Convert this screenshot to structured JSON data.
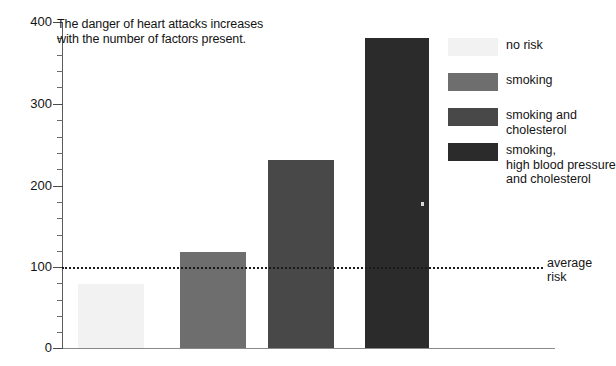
{
  "chart_data": {
    "type": "bar",
    "title": "The danger of heart attacks increases with the number of factors present.",
    "title_lines": [
      "The danger of heart attacks increases",
      "with the number of factors present."
    ],
    "xlabel": "",
    "ylabel": "",
    "ylim": [
      0,
      400
    ],
    "yticks": [
      0,
      100,
      200,
      300,
      400
    ],
    "ytick_labels": [
      "0",
      "100",
      "200",
      "300",
      "400"
    ],
    "minor_tick_step": 20,
    "grid": false,
    "legend_position": "right",
    "categories": [
      "no risk",
      "smoking",
      "smoking and cholesterol",
      "smoking, high blood pressure and cholesterol"
    ],
    "values": [
      78,
      118,
      231,
      380
    ],
    "bar_colors": [
      "#f2f2f2",
      "#6e6e6e",
      "#484848",
      "#2b2b2b"
    ],
    "annotations": [
      {
        "name": "average-risk-line",
        "label_lines": [
          "average",
          "risk"
        ],
        "value": 100,
        "style": "dotted"
      }
    ]
  },
  "title": {
    "line1": "The danger of heart attacks increases",
    "line2": "with the number of factors present."
  },
  "axis": {
    "y": {
      "t400": "400",
      "t300": "300",
      "t200": "200",
      "t100": "100",
      "t0": "0"
    }
  },
  "average_risk": {
    "line1": "average",
    "line2": "risk"
  },
  "legend": {
    "items": [
      {
        "label": "no risk",
        "color": "#f2f2f2"
      },
      {
        "label": "smoking",
        "color": "#6e6e6e"
      },
      {
        "label": "smoking and\ncholesterol",
        "color": "#484848"
      },
      {
        "label": "smoking,\nhigh blood pressure\nand cholesterol",
        "color": "#2b2b2b"
      }
    ]
  }
}
